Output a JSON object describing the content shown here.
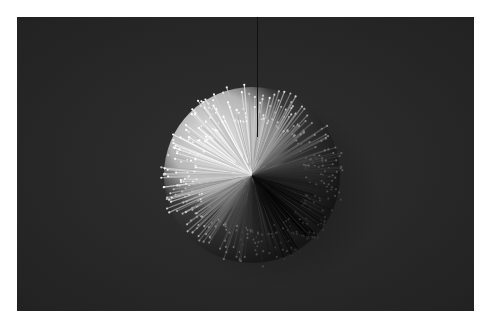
{
  "image": {
    "description": "Black-and-white photograph of a spiky koosh-like ball on a dark textured background",
    "subject": "spiky ball",
    "colors": {
      "background": "#2a2a2a",
      "page": "#ffffff",
      "highlight": "#e6e6e6",
      "shadow": "#141414"
    }
  }
}
